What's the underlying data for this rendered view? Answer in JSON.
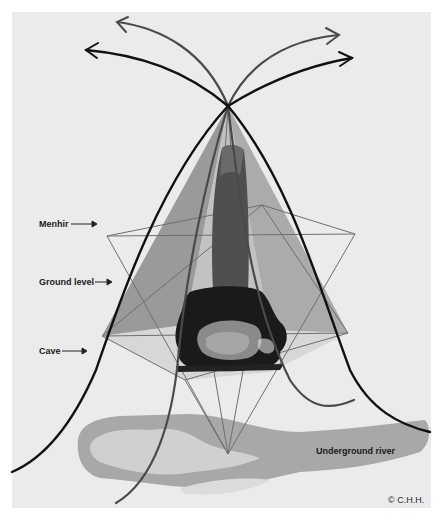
{
  "diagram": {
    "type": "menhir-energy-diagram",
    "background_color": "#ebebeb",
    "labels": {
      "menhir": "Menhir",
      "ground_level": "Ground level",
      "cave": "Cave",
      "underground_river": "Underground river"
    },
    "copyright": "© C.H.H.",
    "colors": {
      "curve_dark": "#111111",
      "curve_gray": "#4a4a4a",
      "pyramid_fill": "#9a9a9a",
      "pyramid_fill_light": "#c4c4c4",
      "star_line": "#6e6e6e",
      "menhir_fill": "#4f4f4f",
      "river_fill": "#a8a8a8",
      "river_light": "#d4d4d4"
    },
    "key_points": {
      "apex": [
        228,
        106
      ],
      "star_left": [
        107,
        236
      ],
      "star_right": [
        355,
        234
      ],
      "star_top": [
        262,
        205
      ],
      "star_bottom": [
        228,
        454
      ],
      "pyramid_left": [
        102,
        336
      ],
      "pyramid_right": [
        348,
        333
      ]
    }
  }
}
